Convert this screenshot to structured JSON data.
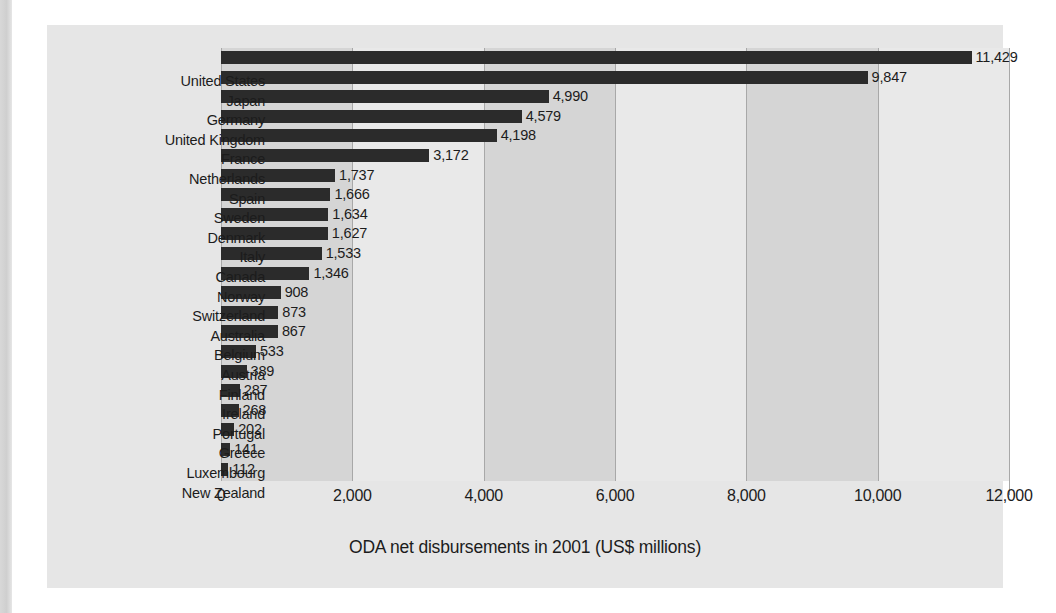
{
  "caption": "ODA net disbursements in 2001 (US$ millions)",
  "colors": {
    "bar": "#2b2b2b",
    "panel": "#e6e6e6",
    "band_dark": "#d5d5d5",
    "band_light": "#e9e9e9",
    "gridline": "#a8a8a8",
    "text": "#1c1c1c"
  },
  "axis": {
    "ticks": [
      "0",
      "2,000",
      "4,000",
      "6,000",
      "8,000",
      "10,000",
      "12,000"
    ],
    "tick_values": [
      0,
      2000,
      4000,
      6000,
      8000,
      10000,
      12000
    ]
  },
  "chart_data": {
    "type": "bar",
    "orientation": "horizontal",
    "title": "",
    "xlabel": "ODA net disbursements in 2001 (US$ millions)",
    "ylabel": "",
    "xlim": [
      0,
      12000
    ],
    "grid": true,
    "legend": "none",
    "categories": [
      "United States",
      "Japan",
      "Germany",
      "United Kingdom",
      "France",
      "Netherlands",
      "Spain",
      "Sweden",
      "Denmark",
      "Italy",
      "Canada",
      "Norway",
      "Switzerland",
      "Australia",
      "Belgium",
      "Austria",
      "Finland",
      "Ireland",
      "Portugal",
      "Greece",
      "Luxembourg",
      "New Zealand"
    ],
    "values": [
      11429,
      9847,
      4990,
      4579,
      4198,
      3172,
      1737,
      1666,
      1634,
      1627,
      1533,
      1346,
      908,
      873,
      867,
      533,
      389,
      287,
      268,
      202,
      141,
      112
    ],
    "value_labels": [
      "11,429",
      "9,847",
      "4,990",
      "4,579",
      "4,198",
      "3,172",
      "1,737",
      "1,666",
      "1,634",
      "1,627",
      "1,533",
      "1,346",
      "908",
      "873",
      "867",
      "533",
      "389",
      "287",
      "268",
      "202",
      "141",
      "112"
    ]
  }
}
